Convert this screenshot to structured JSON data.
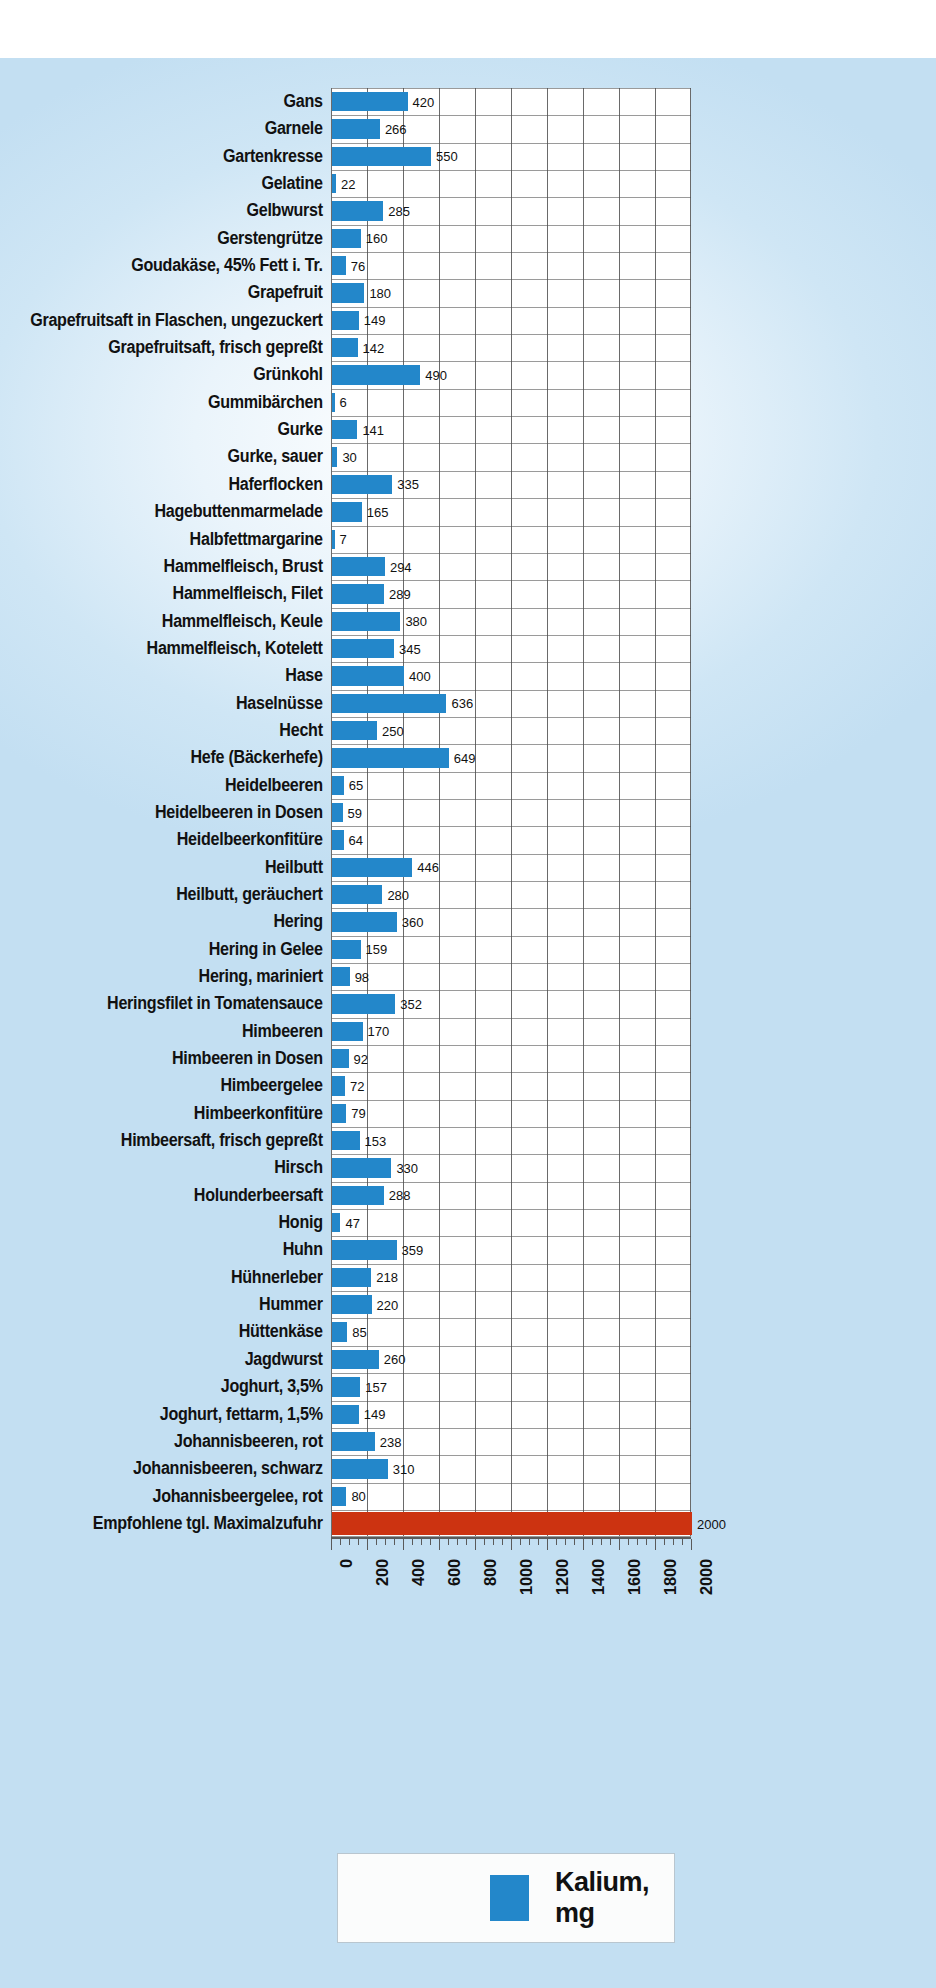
{
  "chart_data": {
    "type": "bar",
    "orientation": "horizontal",
    "title": "",
    "xlabel": "",
    "ylabel": "",
    "xlim": [
      0,
      2000
    ],
    "grid": true,
    "legend_position": "bottom",
    "legend": [
      {
        "label": "Kalium, mg",
        "color": "#2387ca"
      }
    ],
    "tick_labels": [
      "0",
      "200",
      "400",
      "600",
      "800",
      "1000",
      "1200",
      "1400",
      "1600",
      "1800",
      "2000"
    ],
    "tick_values": [
      0,
      200,
      400,
      600,
      800,
      1000,
      1200,
      1400,
      1600,
      1800,
      2000
    ],
    "minor_tick_step": 50,
    "series_color": "#2387ca",
    "reference_color": "#cc3311",
    "categories": [
      "Gans",
      "Garnele",
      "Gartenkresse",
      "Gelatine",
      "Gelbwurst",
      "Gerstengrütze",
      "Goudakäse, 45% Fett i. Tr.",
      "Grapefruit",
      "Grapefruitsaft in Flaschen, ungezuckert",
      "Grapefruitsaft, frisch gepreßt",
      "Grünkohl",
      "Gummibärchen",
      "Gurke",
      "Gurke, sauer",
      "Haferflocken",
      "Hagebuttenmarmelade",
      "Halbfettmargarine",
      "Hammelfleisch, Brust",
      "Hammelfleisch, Filet",
      "Hammelfleisch, Keule",
      "Hammelfleisch, Kotelett",
      "Hase",
      "Haselnüsse",
      "Hecht",
      "Hefe (Bäckerhefe)",
      "Heidelbeeren",
      "Heidelbeeren in Dosen",
      "Heidelbeerkonfitüre",
      "Heilbutt",
      "Heilbutt, geräuchert",
      "Hering",
      "Hering in Gelee",
      "Hering, mariniert",
      "Heringsfilet in Tomatensauce",
      "Himbeeren",
      "Himbeeren in Dosen",
      "Himbeergelee",
      "Himbeerkonfitüre",
      "Himbeersaft, frisch gepreßt",
      "Hirsch",
      "Holunderbeersaft",
      "Honig",
      "Huhn",
      "Hühnerleber",
      "Hummer",
      "Hüttenkäse",
      "Jagdwurst",
      "Joghurt, 3,5%",
      "Joghurt, fettarm, 1,5%",
      "Johannisbeeren, rot",
      "Johannisbeeren, schwarz",
      "Johannisbeergelee, rot",
      "Empfohlene tgl. Maximalzufuhr"
    ],
    "values": [
      420,
      266,
      550,
      22,
      285,
      160,
      76,
      180,
      149,
      142,
      490,
      6,
      141,
      30,
      335,
      165,
      7,
      294,
      289,
      380,
      345,
      400,
      636,
      250,
      649,
      65,
      59,
      64,
      446,
      280,
      360,
      159,
      98,
      352,
      170,
      92,
      72,
      79,
      153,
      330,
      288,
      47,
      359,
      218,
      220,
      85,
      260,
      157,
      149,
      238,
      310,
      80,
      2000
    ],
    "value_labels": [
      "420",
      "266",
      "550",
      "22",
      "285",
      "160",
      "76",
      "180",
      "149",
      "142",
      "490",
      "6",
      "141",
      "30",
      "335",
      "165",
      "7",
      "294",
      "289",
      "380",
      "345",
      "400",
      "636",
      "250",
      "649",
      "65",
      "59",
      "64",
      "446",
      "280",
      "360",
      "159",
      "98",
      "352",
      "170",
      "92",
      "72",
      "79",
      "153",
      "330",
      "288",
      "47",
      "359",
      "218",
      "220",
      "85",
      "260",
      "157",
      "149",
      "238",
      "310",
      "80",
      "2000"
    ],
    "highlight_index": 52
  }
}
